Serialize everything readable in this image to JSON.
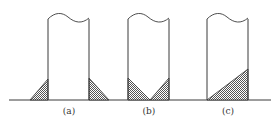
{
  "diagram": {
    "colors": {
      "line": "#3a3a3a",
      "hatch": "#6a6a6a",
      "background": "#ffffff"
    },
    "panels": [
      {
        "id": "a",
        "label": "(a)",
        "fill": "triangular fillets on both outer sides of the wall"
      },
      {
        "id": "b",
        "label": "(b)",
        "fill": "triangular fillets on both inner sides meeting in a V"
      },
      {
        "id": "c",
        "label": "(c)",
        "fill": "single large triangular fill inside the wall, rising to the right"
      }
    ]
  }
}
